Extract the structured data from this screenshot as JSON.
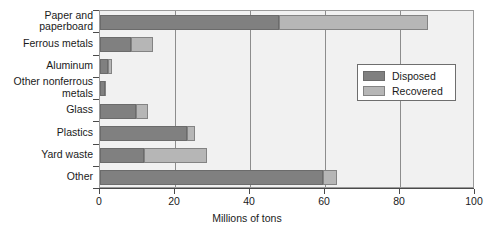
{
  "chart_data": {
    "type": "bar",
    "orientation": "horizontal",
    "stacked": true,
    "title": "",
    "xlabel": "Millions of tons",
    "ylabel": "",
    "xlim": [
      0,
      100
    ],
    "xticks": [
      0,
      20,
      40,
      60,
      80,
      100
    ],
    "grid": true,
    "grid_axis": "x",
    "legend_position": "right-upper-inside",
    "categories": [
      "Paper and paperboard",
      "Ferrous metals",
      "Aluminum",
      "Other nonferrous metals",
      "Glass",
      "Plastics",
      "Yard waste",
      "Other"
    ],
    "category_labels": [
      [
        "Paper and",
        "paperboard"
      ],
      [
        "Ferrous metals"
      ],
      [
        "Aluminum"
      ],
      [
        "Other nonferrous",
        "metals"
      ],
      [
        "Glass"
      ],
      [
        "Plastics"
      ],
      [
        "Yard waste"
      ],
      [
        "Other"
      ]
    ],
    "series": [
      {
        "name": "Disposed",
        "color": "#808080",
        "values": [
          47.8,
          8.3,
          2.1,
          1.3,
          9.6,
          23.2,
          11.7,
          59.5
        ]
      },
      {
        "name": "Recovered",
        "color": "#b6b6b6",
        "values": [
          39.7,
          5.8,
          1.2,
          0.3,
          3.2,
          2.1,
          16.8,
          3.7
        ]
      }
    ],
    "totals": [
      87.5,
      14.1,
      3.3,
      1.6,
      12.8,
      25.3,
      28.5,
      63.2
    ]
  },
  "legend": {
    "entries": [
      {
        "label": "Disposed",
        "color": "#808080"
      },
      {
        "label": "Recovered",
        "color": "#b6b6b6"
      }
    ]
  },
  "axis": {
    "x_title": "Millions of tons",
    "x_tick_labels": [
      "0",
      "20",
      "40",
      "60",
      "80",
      "100"
    ]
  }
}
